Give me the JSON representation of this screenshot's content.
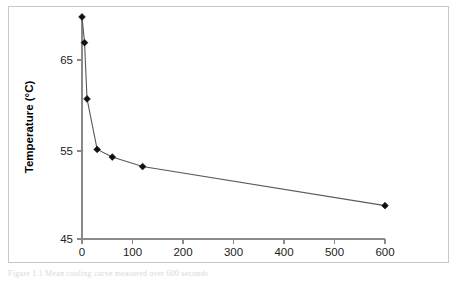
{
  "figure": {
    "caption_partial": "Figure  1.1 Mean cooling curve measured over 600 seconds",
    "border_color": "#c8c8c8"
  },
  "chart_data": {
    "type": "line",
    "title": "",
    "subtitle": "",
    "xlabel": "Time (Seconds)",
    "ylabel": "Temperature (°C)",
    "xlim": [
      0,
      600
    ],
    "ylim": [
      45,
      68.5
    ],
    "xticks": [
      0,
      100,
      200,
      300,
      400,
      500,
      600
    ],
    "xticklabels": [
      "0",
      "100",
      "200",
      "300",
      "400",
      "500",
      "600"
    ],
    "yticks": [
      45,
      55,
      65
    ],
    "yticklabels": [
      "45",
      "55",
      "65"
    ],
    "grid": false,
    "legend": null,
    "marker": "diamond",
    "series": [
      {
        "name": "Temperature",
        "x": [
          0,
          5,
          10,
          30,
          60,
          120,
          600
        ],
        "y": [
          68.3,
          65.6,
          59.7,
          54.4,
          53.6,
          52.6,
          48.5
        ],
        "line_color": "#5a5a5a",
        "marker_color": "#111111"
      }
    ]
  },
  "axes": {
    "y_axis_title": "Temperature (°C)",
    "x_axis_title": "Time (Seconds)"
  }
}
